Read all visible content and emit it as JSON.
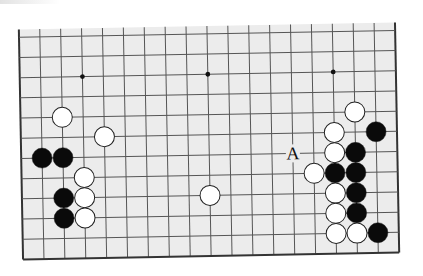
{
  "diagram": {
    "type": "go-board",
    "board_size": 19,
    "visible_rows": 12,
    "edges_shown": [
      "left",
      "right",
      "bottom"
    ],
    "colors": {
      "board": "#ececec",
      "grid": "#555555",
      "edge": "#333333",
      "black_stone": "#0a0a0a",
      "white_stone": "#ffffff",
      "stone_outline": "#222222"
    },
    "star_points": [
      {
        "col": 4,
        "row": 10
      },
      {
        "col": 10,
        "row": 10
      },
      {
        "col": 16,
        "row": 10
      },
      {
        "col": 4,
        "row": 4
      },
      {
        "col": 10,
        "row": 4
      },
      {
        "col": 16,
        "row": 4
      }
    ],
    "stones": [
      {
        "color": "white",
        "col": 3,
        "row": 8
      },
      {
        "color": "white",
        "col": 5,
        "row": 7
      },
      {
        "color": "black",
        "col": 2,
        "row": 6
      },
      {
        "color": "black",
        "col": 3,
        "row": 6
      },
      {
        "color": "white",
        "col": 4,
        "row": 5
      },
      {
        "color": "black",
        "col": 3,
        "row": 4
      },
      {
        "color": "white",
        "col": 4,
        "row": 4
      },
      {
        "color": "black",
        "col": 3,
        "row": 3
      },
      {
        "color": "white",
        "col": 4,
        "row": 3
      },
      {
        "color": "white",
        "col": 10,
        "row": 4
      },
      {
        "color": "white",
        "col": 17,
        "row": 8
      },
      {
        "color": "white",
        "col": 16,
        "row": 7
      },
      {
        "color": "black",
        "col": 18,
        "row": 7
      },
      {
        "color": "white",
        "col": 16,
        "row": 6
      },
      {
        "color": "black",
        "col": 17,
        "row": 6
      },
      {
        "color": "white",
        "col": 15,
        "row": 5
      },
      {
        "color": "black",
        "col": 16,
        "row": 5
      },
      {
        "color": "black",
        "col": 17,
        "row": 5
      },
      {
        "color": "white",
        "col": 16,
        "row": 4
      },
      {
        "color": "black",
        "col": 17,
        "row": 4
      },
      {
        "color": "white",
        "col": 16,
        "row": 3
      },
      {
        "color": "black",
        "col": 17,
        "row": 3
      },
      {
        "color": "white",
        "col": 16,
        "row": 2
      },
      {
        "color": "white",
        "col": 17,
        "row": 2
      },
      {
        "color": "black",
        "col": 18,
        "row": 2
      }
    ],
    "labels": [
      {
        "text": "A",
        "col": 14,
        "row": 6
      }
    ]
  }
}
